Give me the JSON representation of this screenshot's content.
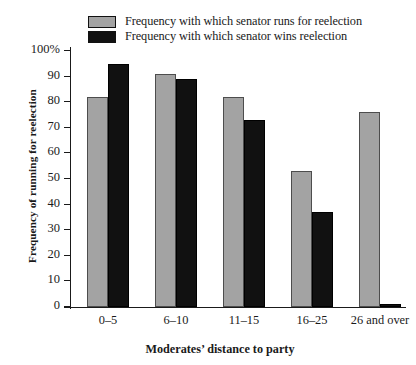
{
  "chart_data": {
    "type": "bar",
    "title": "",
    "xlabel": "Moderates’ distance to party",
    "ylabel": "Frequency of running for reelection",
    "categories": [
      "0–5",
      "6–10",
      "11–15",
      "16–25",
      "26 and over"
    ],
    "series": [
      {
        "name": "Frequency with which senator runs for reelection",
        "color": "#a3a3a3",
        "values": [
          82,
          91,
          82,
          53,
          76
        ]
      },
      {
        "name": "Frequency with which senator wins reelection",
        "color": "#111111",
        "values": [
          95,
          89,
          73,
          37,
          1
        ]
      }
    ],
    "ylim": [
      0,
      100
    ],
    "ytick_values": [
      0,
      10,
      20,
      30,
      40,
      50,
      60,
      70,
      80,
      90,
      100
    ],
    "ytick_labels": [
      "0",
      "10",
      "20",
      "30",
      "40",
      "50",
      "60",
      "70",
      "80",
      "90",
      "100%"
    ],
    "grid": false,
    "legend_position": "top"
  },
  "legend": {
    "items": [
      {
        "label": "Frequency with which senator runs for reelection",
        "swatch": "series-runs"
      },
      {
        "label": "Frequency with which senator wins reelection",
        "swatch": "series-wins"
      }
    ]
  }
}
